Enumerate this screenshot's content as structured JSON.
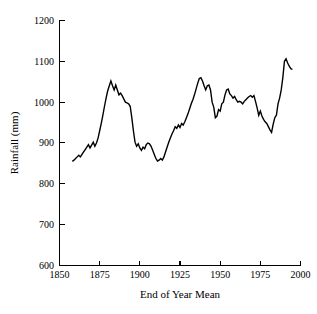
{
  "figure": {
    "background_color": "#ffffff",
    "line_color": "#000000",
    "axis_color": "#000000"
  },
  "labels": {
    "xlabel": "End of Year Mean",
    "ylabel": "Rainfall (mm)",
    "x_ticks": [
      "1850",
      "1875",
      "1900",
      "1925",
      "1950",
      "1975",
      "2000"
    ],
    "y_ticks": [
      "600",
      "700",
      "800",
      "900",
      "1000",
      "1100",
      "1200"
    ]
  },
  "chart_data": {
    "type": "line",
    "title": "",
    "xlabel": "End of Year Mean",
    "ylabel": "Rainfall (mm)",
    "xlim": [
      1850,
      2000
    ],
    "ylim": [
      600,
      1200
    ],
    "xticks": [
      1850,
      1875,
      1900,
      1925,
      1950,
      1975,
      2000
    ],
    "yticks": [
      600,
      700,
      800,
      900,
      1000,
      1100,
      1200
    ],
    "grid": false,
    "legend": "none",
    "series": [
      {
        "name": "End of year mean rainfall",
        "x": [
          1858,
          1859,
          1860,
          1861,
          1862,
          1863,
          1864,
          1865,
          1866,
          1867,
          1868,
          1869,
          1870,
          1871,
          1872,
          1873,
          1874,
          1875,
          1876,
          1877,
          1878,
          1879,
          1880,
          1881,
          1882,
          1883,
          1884,
          1885,
          1886,
          1887,
          1888,
          1889,
          1890,
          1891,
          1892,
          1893,
          1894,
          1895,
          1896,
          1897,
          1898,
          1899,
          1900,
          1901,
          1902,
          1903,
          1904,
          1905,
          1906,
          1907,
          1908,
          1909,
          1910,
          1911,
          1912,
          1913,
          1914,
          1915,
          1916,
          1917,
          1918,
          1919,
          1920,
          1921,
          1922,
          1923,
          1924,
          1925,
          1926,
          1927,
          1928,
          1929,
          1930,
          1931,
          1932,
          1933,
          1934,
          1935,
          1936,
          1937,
          1938,
          1939,
          1940,
          1941,
          1942,
          1943,
          1944,
          1945,
          1946,
          1947,
          1948,
          1949,
          1950,
          1951,
          1952,
          1953,
          1954,
          1955,
          1956,
          1957,
          1958,
          1959,
          1960,
          1961,
          1962,
          1963,
          1964,
          1965,
          1966,
          1967,
          1968,
          1969,
          1970,
          1971,
          1972,
          1973,
          1974,
          1975,
          1976,
          1977,
          1978,
          1979,
          1980,
          1981,
          1982,
          1983,
          1984,
          1985,
          1986,
          1987,
          1988,
          1989,
          1990,
          1991,
          1992,
          1993,
          1994,
          1995
        ],
        "values": [
          855,
          858,
          862,
          866,
          870,
          866,
          872,
          878,
          884,
          890,
          896,
          888,
          895,
          902,
          892,
          900,
          912,
          930,
          948,
          968,
          990,
          1010,
          1028,
          1040,
          1052,
          1040,
          1030,
          1042,
          1030,
          1018,
          1022,
          1016,
          1008,
          1000,
          998,
          996,
          990,
          962,
          930,
          902,
          892,
          898,
          888,
          882,
          890,
          886,
          896,
          900,
          898,
          892,
          882,
          872,
          862,
          856,
          858,
          862,
          858,
          866,
          878,
          890,
          902,
          912,
          922,
          930,
          940,
          936,
          944,
          938,
          948,
          944,
          952,
          962,
          972,
          984,
          996,
          1006,
          1018,
          1032,
          1046,
          1058,
          1060,
          1052,
          1040,
          1030,
          1040,
          1042,
          1030,
          1000,
          988,
          962,
          966,
          982,
          978,
          996,
          1000,
          1018,
          1030,
          1032,
          1020,
          1016,
          1010,
          1014,
          1006,
          1000,
          1002,
          1000,
          996,
          1002,
          1006,
          1010,
          1014,
          1016,
          1012,
          1016,
          1002,
          986,
          968,
          978,
          966,
          958,
          952,
          948,
          940,
          932,
          926,
          946,
          962,
          968,
          996,
          1010,
          1030,
          1060,
          1100,
          1106,
          1096,
          1088,
          1082,
          1080
        ]
      }
    ]
  }
}
